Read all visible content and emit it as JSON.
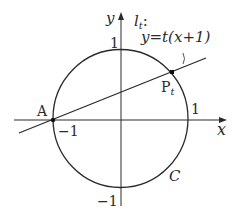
{
  "figure": {
    "axes": {
      "x_label": "x",
      "y_label": "y",
      "x_tick_neg": "−1",
      "x_tick_pos": "1",
      "y_tick_pos": "1",
      "y_tick_neg": "−1"
    },
    "circle": {
      "label": "C",
      "equation_hint": "unit circle"
    },
    "line": {
      "name": "l",
      "name_sub": "t",
      "colon": ":",
      "equation": "y=t(x+1)"
    },
    "points": {
      "A": {
        "label": "A"
      },
      "P": {
        "label": "P",
        "sub": "t"
      }
    },
    "colors": {
      "stroke": "#2a2a2a",
      "background": "#ffffff"
    }
  }
}
